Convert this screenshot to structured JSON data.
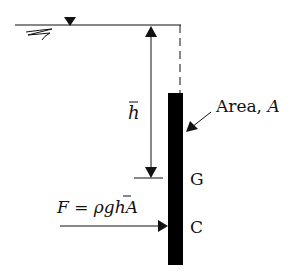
{
  "diagram": {
    "labels": {
      "depth": "h",
      "area": "Area, ",
      "area_symbol": "A",
      "centroid": "G",
      "center_of_pressure": "C",
      "force_lhs": "F",
      "force_eq": " = ",
      "force_rho_g": "ρg",
      "force_h": "h",
      "force_A": "A"
    },
    "colors": {
      "line": "#111111",
      "plate": "#000000",
      "background": "#ffffff"
    },
    "elements": [
      "free-surface",
      "free-surface-marker",
      "depth-dimension-arrow",
      "submerged-plate",
      "centroid-marker",
      "resultant-force-arrow",
      "area-pointer-arrow"
    ]
  }
}
